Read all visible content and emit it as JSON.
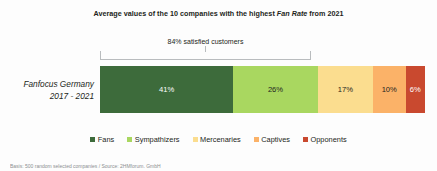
{
  "chart_data": {
    "type": "bar",
    "orientation": "horizontal-stacked",
    "title_prefix": "Average values of the 10 companies with the highest ",
    "title_italic": "Fan Rate",
    "title_suffix": " from 2021",
    "title_full": "Average values of the 10 companies with the highest Fan Rate from 2021",
    "categories": [
      "Fanfocus Germany 2017 - 2021"
    ],
    "category_line1": "Fanfocus Germany",
    "category_line2": "2017 - 2021",
    "series": [
      {
        "name": "Fans",
        "value": 41,
        "label": "41%",
        "color": "#3d6b3b",
        "text_color": "#ffffff"
      },
      {
        "name": "Sympathizers",
        "value": 26,
        "label": "26%",
        "color": "#a9d760",
        "text_color": "#231f20"
      },
      {
        "name": "Mercenaries",
        "value": 17,
        "label": "17%",
        "color": "#fbdd8f",
        "text_color": "#231f20"
      },
      {
        "name": "Captives",
        "value": 10,
        "label": "10%",
        "color": "#fbb268",
        "text_color": "#231f20"
      },
      {
        "name": "Opponents",
        "value": 6,
        "label": "6%",
        "color": "#c9492f",
        "text_color": "#ffffff"
      }
    ],
    "total": 100,
    "unit": "%",
    "annotation": {
      "text": "84% satisfied customers",
      "value": 84,
      "covers": [
        "Fans",
        "Sympathizers",
        "Mercenaries"
      ]
    },
    "legend_position": "bottom",
    "grid": false,
    "xlabel": "",
    "ylabel": ""
  },
  "footnote": {
    "text": "Basis: 500 random selected companies / Source: 2HMforum. GmbH"
  }
}
